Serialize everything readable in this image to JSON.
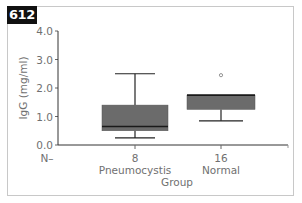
{
  "figure": {
    "badge": "612"
  },
  "chart_data": {
    "type": "box",
    "title": "",
    "xlabel": "Group",
    "ylabel": "IgG (mg/ml)",
    "ylim": [
      0,
      4
    ],
    "yticks": [
      "0.0",
      "1.0",
      "2.0",
      "3.0",
      "4.0"
    ],
    "grid": false,
    "legend": null,
    "n_label": "N–",
    "categories": [
      "Pneumocystis",
      "Normal"
    ],
    "n": [
      "8",
      "16"
    ],
    "series": [
      {
        "name": "Pneumocystis",
        "n": 8,
        "whisker_low": 0.25,
        "q1": 0.5,
        "median": 0.65,
        "q3": 1.4,
        "whisker_high": 2.5,
        "outliers": []
      },
      {
        "name": "Normal",
        "n": 16,
        "whisker_low": 0.85,
        "q1": 1.25,
        "median": 1.75,
        "q3": 1.75,
        "whisker_high": 1.75,
        "outliers": [
          2.45
        ]
      }
    ],
    "colors": {
      "box_fill": "#6b6b6b",
      "line": "#222222",
      "axis_text": "#707070"
    }
  }
}
